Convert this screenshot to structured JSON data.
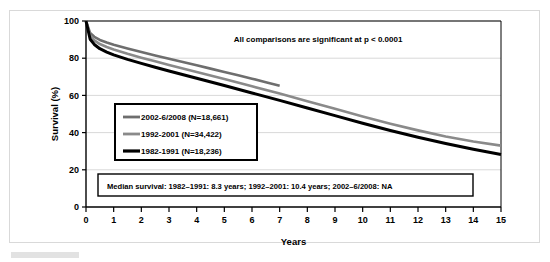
{
  "figure": {
    "annotation": "All comparisons are significant at p < 0.0001",
    "median_note": "Median survival:  1982–1991: 8.3 years; 1992–2001: 10.4 years; 2002–6/2008: NA"
  },
  "chart_data": {
    "type": "line",
    "title": "",
    "subtitle": "",
    "xlabel": "Years",
    "ylabel": "Survival (%)",
    "xlim": [
      0,
      15
    ],
    "ylim": [
      0,
      100
    ],
    "xticks": [
      0,
      1,
      2,
      3,
      4,
      5,
      6,
      7,
      8,
      9,
      10,
      11,
      12,
      13,
      14,
      15
    ],
    "yticks": [
      0,
      20,
      40,
      60,
      80,
      100
    ],
    "grid": "horizontal",
    "legend_position": "inside-left",
    "annotations": [
      "All comparisons are significant at p < 0.0001",
      "Median survival:  1982–1991: 8.3 years; 1992–2001: 10.4 years; 2002–6/2008: NA"
    ],
    "series": [
      {
        "name": "2002-6/2008 (N=18,661)",
        "color": "#6e6e6e",
        "width": 2.6,
        "x": [
          0,
          0.15,
          0.3,
          0.5,
          0.75,
          1,
          1.5,
          2,
          2.5,
          3,
          3.5,
          4,
          4.5,
          5,
          5.5,
          6,
          6.5,
          7
        ],
        "y": [
          100,
          93.5,
          91.5,
          89.8,
          88.4,
          87.2,
          85.2,
          83.3,
          81.5,
          79.7,
          78.0,
          76.2,
          74.4,
          72.6,
          70.8,
          69.0,
          67.1,
          65.2
        ]
      },
      {
        "name": "1992-2001 (N=34,422)",
        "color": "#8a8a8a",
        "width": 2.6,
        "x": [
          0,
          0.15,
          0.3,
          0.5,
          0.75,
          1,
          1.5,
          2,
          2.5,
          3,
          4,
          5,
          6,
          7,
          8,
          9,
          10,
          11,
          12,
          13,
          14,
          15
        ],
        "y": [
          100,
          92.0,
          89.6,
          87.6,
          86.0,
          84.7,
          82.4,
          80.3,
          78.3,
          76.4,
          72.6,
          68.8,
          64.9,
          61.0,
          56.9,
          52.8,
          48.7,
          44.8,
          41.2,
          37.9,
          35.2,
          33.0
        ]
      },
      {
        "name": "1982-1991 (N=18,236)",
        "color": "#000000",
        "width": 3.0,
        "x": [
          0,
          0.15,
          0.3,
          0.5,
          0.75,
          1,
          1.5,
          2,
          2.5,
          3,
          4,
          5,
          6,
          7,
          8,
          9,
          10,
          11,
          12,
          13,
          14,
          15
        ],
        "y": [
          100,
          90.2,
          87.4,
          85.1,
          83.3,
          81.8,
          79.4,
          77.2,
          75.1,
          73.1,
          69.2,
          65.3,
          61.3,
          57.3,
          53.2,
          49.1,
          45.0,
          41.1,
          37.5,
          34.1,
          31.0,
          28.2
        ]
      }
    ]
  },
  "legend": {
    "items": [
      {
        "label": "2002-6/2008 (N=18,661)",
        "color": "#6e6e6e"
      },
      {
        "label": "1992-2001 (N=34,422)",
        "color": "#8a8a8a"
      },
      {
        "label": "1982-1991 (N=18,236)",
        "color": "#000000"
      }
    ]
  },
  "axes": {
    "y_title": "Survival (%)",
    "x_title": "Years",
    "y_ticks": [
      "0",
      "20",
      "40",
      "60",
      "80",
      "100"
    ],
    "x_ticks": [
      "0",
      "1",
      "2",
      "3",
      "4",
      "5",
      "6",
      "7",
      "8",
      "9",
      "10",
      "11",
      "12",
      "13",
      "14",
      "15"
    ]
  },
  "colors": {
    "frame": "#d9d9d9",
    "grid": "#c8c8c8",
    "axis": "#000000",
    "background": "#ffffff"
  }
}
